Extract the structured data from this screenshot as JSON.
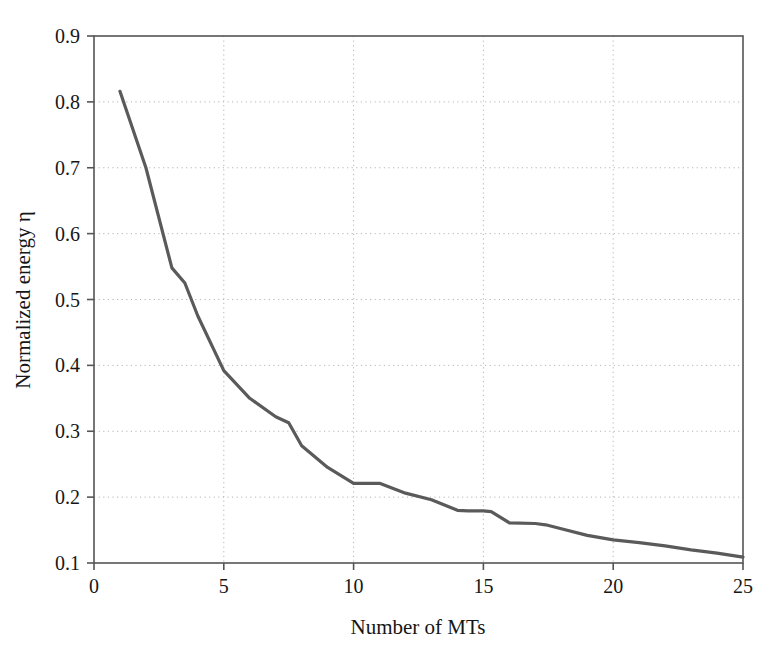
{
  "chart_data": {
    "type": "line",
    "title": "",
    "subtitle": "",
    "xlabel": "Number of MTs",
    "ylabel": "Normalized energy η",
    "xlim": [
      0,
      25
    ],
    "ylim": [
      0.1,
      0.9
    ],
    "xticks": [
      "0",
      "5",
      "10",
      "15",
      "20",
      "25"
    ],
    "xtick_values": [
      0,
      5,
      10,
      15,
      20,
      25
    ],
    "yticks": [
      "0.1",
      "0.2",
      "0.3",
      "0.4",
      "0.5",
      "0.6",
      "0.7",
      "0.8",
      "0.9"
    ],
    "ytick_values": [
      0.1,
      0.2,
      0.3,
      0.4,
      0.5,
      0.6,
      0.7,
      0.8,
      0.9
    ],
    "grid": true,
    "grid_style": "dotted",
    "legend": null,
    "legend_position": "none",
    "line_color": "#5a5a5a",
    "axis_color": "#555555",
    "grid_color": "#b5b5b5",
    "background_color": "#ffffff",
    "series": [
      {
        "name": "Normalized energy",
        "x": [
          1,
          2,
          3,
          3.5,
          4,
          5,
          6,
          7,
          7.5,
          8,
          9,
          10,
          11,
          12,
          13,
          14,
          14.4,
          15,
          15.3,
          16,
          17,
          17.4,
          18,
          19,
          20,
          21,
          22,
          23,
          24,
          25
        ],
        "values": [
          0.816,
          0.7,
          0.548,
          0.525,
          0.475,
          0.392,
          0.35,
          0.322,
          0.313,
          0.278,
          0.245,
          0.221,
          0.221,
          0.206,
          0.196,
          0.18,
          0.179,
          0.179,
          0.178,
          0.161,
          0.16,
          0.158,
          0.152,
          0.142,
          0.135,
          0.131,
          0.126,
          0.12,
          0.115,
          0.109
        ]
      }
    ]
  },
  "axes": {
    "ylabel_text": "Normalized energy η",
    "xlabel_text": "Number of MTs"
  }
}
